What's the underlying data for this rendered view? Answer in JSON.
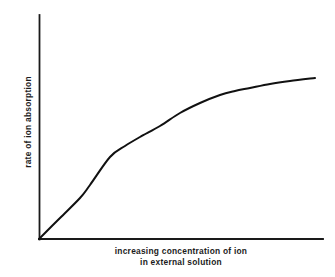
{
  "figure": {
    "background_color": "#ffffff",
    "line_color": "#111111",
    "axis_color": "#1a1a1a",
    "text_color": "#1c1c1c"
  },
  "labels": {
    "ylabel": "rate of ion absorption",
    "xlabel_line1": "increasing concentration of ion",
    "xlabel_line2": "in external solution"
  },
  "chart_data": {
    "type": "line",
    "title": "",
    "subtitle": "",
    "xlabel": "increasing concentration of ion in external solution",
    "ylabel": "rate of ion absorption",
    "grid": false,
    "legend": false,
    "legend_position": "none",
    "xlim": [
      0,
      1
    ],
    "ylim": [
      0,
      1
    ],
    "x_tick_labels": [],
    "y_tick_labels": [],
    "axis_style": "two-spine-open-L",
    "annotations": [],
    "series": [
      {
        "name": "rate of ion absorption",
        "description": "saturation curve: rises steeply and near-linearly from the origin, then bends and plateaus toward a maximum rate",
        "x": [
          0.0,
          0.07,
          0.14,
          0.18,
          0.25,
          0.32,
          0.36,
          0.43,
          0.5,
          0.57,
          0.64,
          0.71,
          0.79,
          0.86,
          0.93,
          0.97
        ],
        "y": [
          0.0,
          0.13,
          0.18,
          0.24,
          0.34,
          0.43,
          0.46,
          0.54,
          0.61,
          0.67,
          0.71,
          0.74,
          0.685,
          0.7,
          0.71,
          0.72
        ]
      }
    ],
    "pixel_points": [
      [
        39,
        239
      ],
      [
        60,
        218
      ],
      [
        80,
        198
      ],
      [
        90,
        185
      ],
      [
        110,
        157
      ],
      [
        125,
        146
      ],
      [
        140,
        137
      ],
      [
        160,
        126
      ],
      [
        180,
        113
      ],
      [
        200,
        103
      ],
      [
        220,
        95
      ],
      [
        235,
        91
      ],
      [
        250,
        88
      ],
      [
        270,
        84
      ],
      [
        290,
        81
      ],
      [
        315,
        78
      ]
    ]
  }
}
